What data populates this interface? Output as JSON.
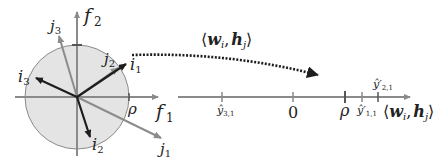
{
  "colors": {
    "circle_fill": "#e4e4e4",
    "circle_stroke": "#8a8a8a",
    "axis": "#8a8a8a",
    "dark_vector": "#1e1e1e",
    "light_vector": "#8c8c8c",
    "dotted_arrow": "#1e1e1e"
  },
  "left_panel": {
    "axes": {
      "x_label": "f",
      "x_sub": "1",
      "y_label": "f",
      "y_sub": "2"
    },
    "radius_label": "ρ",
    "vectors": [
      {
        "name": "i",
        "sub": "1",
        "style": "dark"
      },
      {
        "name": "i",
        "sub": "2",
        "style": "dark"
      },
      {
        "name": "i",
        "sub": "3",
        "style": "dark"
      },
      {
        "name": "j",
        "sub": "1",
        "style": "light"
      },
      {
        "name": "j",
        "sub": "2",
        "style": "light"
      },
      {
        "name": "j",
        "sub": "3",
        "style": "light"
      }
    ]
  },
  "mapping_arrow": {
    "label_open": "⟨",
    "label_w": "w",
    "label_w_sub": "i",
    "label_comma": ",",
    "label_h": "h",
    "label_h_sub": "j",
    "label_close": "⟩"
  },
  "number_line": {
    "axis_label_open": "⟨",
    "axis_label_w": "w",
    "axis_label_w_sub": "i",
    "axis_label_comma": ",",
    "axis_label_h": "h",
    "axis_label_h_sub": "j",
    "axis_label_close": "⟩",
    "ticks": [
      {
        "label": "ŷ",
        "sub": "3,1",
        "position": "below"
      },
      {
        "label": "0",
        "sub": "",
        "position": "below"
      },
      {
        "label": "ρ",
        "sub": "",
        "position": "below"
      },
      {
        "label": "ŷ′",
        "sub": "1,1",
        "position": "below"
      },
      {
        "label": "ŷ′",
        "sub": "2,1",
        "position": "above"
      }
    ]
  }
}
